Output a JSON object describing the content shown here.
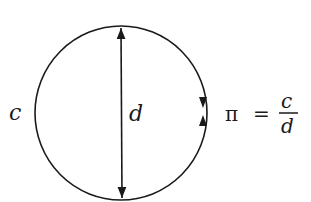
{
  "diagram": {
    "shapes": {
      "circle": {
        "cx": 121,
        "cy": 113,
        "rx": 86,
        "ry": 87,
        "stroke": "#1a1a1a"
      },
      "diameter": {
        "x1": 121,
        "y1": 27,
        "x2": 122,
        "y2": 199
      }
    },
    "labels": {
      "circumference": "c",
      "diameter": "d"
    },
    "formula": {
      "lhs": "π",
      "equals": "=",
      "numerator": "c",
      "denominator": "d"
    }
  }
}
